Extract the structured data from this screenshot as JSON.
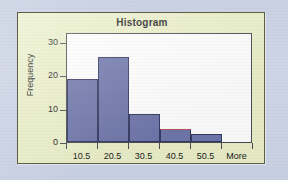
{
  "card": {
    "title": "Histogram",
    "background_color": "#ebf0c9",
    "border_color": "#5d6044",
    "page_background_color": "#ccd3e4"
  },
  "chart_data": {
    "type": "bar",
    "title": "Histogram",
    "xlabel": "",
    "ylabel": "Frequency",
    "categories": [
      "10.5",
      "20.5",
      "30.5",
      "40.5",
      "50.5",
      "More"
    ],
    "values": [
      19,
      25.5,
      8.5,
      4,
      2.5,
      0
    ],
    "ylim": [
      0,
      33
    ],
    "yticks": [
      0,
      10,
      20,
      30
    ],
    "ytick_labels": [
      "0",
      "10",
      "20",
      "30"
    ],
    "grid": false,
    "legend": "none",
    "bar_fill_color": "#6f77ab",
    "bar_border_color": "#343a63",
    "accent_color": "#b8545f",
    "plot_background_color": "#ffffff",
    "plot_border_color": "#4c4c55",
    "bars": [
      {
        "category": "10.5",
        "value": 19,
        "accent_top": false
      },
      {
        "category": "20.5",
        "value": 25.5,
        "accent_top": false
      },
      {
        "category": "30.5",
        "value": 8.5,
        "accent_top": false
      },
      {
        "category": "40.5",
        "value": 4,
        "accent_top": true
      },
      {
        "category": "50.5",
        "value": 2.5,
        "accent_top": false
      },
      {
        "category": "More",
        "value": 0,
        "accent_top": false
      }
    ]
  }
}
